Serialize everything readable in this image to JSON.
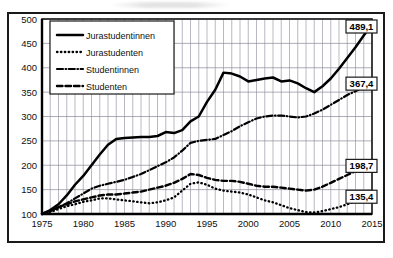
{
  "chart_data": {
    "type": "line",
    "title": "",
    "xlabel": "",
    "ylabel": "",
    "xlim": [
      1975,
      2015
    ],
    "ylim": [
      100,
      500
    ],
    "grid": true,
    "legend_position": "top-left",
    "y_ticks": [
      "500",
      "450",
      "400",
      "350",
      "300",
      "250",
      "200",
      "150",
      "100"
    ],
    "x_ticks": [
      "1975",
      "1980",
      "1985",
      "1990",
      "1995",
      "2000",
      "2005",
      "2010",
      "2015"
    ],
    "x_values": [
      1975,
      1976,
      1977,
      1978,
      1979,
      1980,
      1981,
      1982,
      1983,
      1984,
      1985,
      1986,
      1987,
      1988,
      1989,
      1990,
      1991,
      1992,
      1993,
      1994,
      1995,
      1996,
      1997,
      1998,
      1999,
      2000,
      2001,
      2002,
      2003,
      2004,
      2005,
      2006,
      2007,
      2008,
      2009,
      2010,
      2011,
      2012,
      2013,
      2014,
      2015
    ],
    "series": [
      {
        "name": "Jurastudentinnen",
        "style": "solid",
        "end_label": "489,1",
        "values": [
          100,
          108,
          120,
          138,
          160,
          178,
          200,
          222,
          242,
          254,
          256,
          257,
          258,
          258,
          260,
          268,
          266,
          272,
          290,
          300,
          330,
          355,
          390,
          388,
          382,
          372,
          375,
          378,
          380,
          372,
          374,
          368,
          358,
          350,
          362,
          378,
          398,
          420,
          442,
          466,
          489.1
        ]
      },
      {
        "name": "Jurastudenten",
        "style": "dotted",
        "end_label": "135,4",
        "values": [
          100,
          104,
          110,
          116,
          120,
          125,
          128,
          132,
          132,
          130,
          128,
          126,
          124,
          122,
          124,
          128,
          134,
          148,
          162,
          165,
          160,
          152,
          148,
          146,
          144,
          140,
          134,
          128,
          124,
          118,
          112,
          108,
          104,
          103,
          106,
          110,
          114,
          120,
          126,
          131,
          135.4
        ]
      },
      {
        "name": "Studentinnen",
        "style": "dash-dot",
        "end_label": "367,4",
        "values": [
          100,
          106,
          114,
          122,
          132,
          142,
          152,
          158,
          162,
          166,
          170,
          176,
          182,
          190,
          198,
          206,
          216,
          230,
          246,
          250,
          252,
          254,
          262,
          270,
          280,
          288,
          296,
          300,
          302,
          302,
          300,
          298,
          300,
          306,
          314,
          324,
          334,
          344,
          352,
          360,
          367.4
        ]
      },
      {
        "name": "Studenten",
        "style": "dashed",
        "end_label": "198,7",
        "values": [
          100,
          106,
          114,
          120,
          126,
          130,
          134,
          138,
          140,
          140,
          142,
          144,
          146,
          150,
          154,
          158,
          164,
          172,
          182,
          180,
          174,
          170,
          168,
          168,
          166,
          162,
          158,
          156,
          156,
          154,
          152,
          150,
          148,
          150,
          156,
          164,
          172,
          180,
          188,
          194,
          198.7
        ]
      }
    ]
  },
  "legend": {
    "items": [
      {
        "label": "Jurastudentinnen",
        "swatch": "solid-line-swatch"
      },
      {
        "label": "Jurastudenten",
        "swatch": "dotted-line-swatch"
      },
      {
        "label": "Studentinnen",
        "swatch": "dash-dot-line-swatch"
      },
      {
        "label": "Studenten",
        "swatch": "dashed-line-swatch"
      }
    ]
  },
  "end_labels": [
    {
      "value": "489,1",
      "series": "Jurastudentinnen"
    },
    {
      "value": "367,4",
      "series": "Studentinnen"
    },
    {
      "value": "198,7",
      "series": "Studenten"
    },
    {
      "value": "135,4",
      "series": "Jurastudenten"
    }
  ],
  "colors": {
    "ink": "#000000",
    "grid": "#8a8a9a",
    "background": "#ffffff"
  }
}
